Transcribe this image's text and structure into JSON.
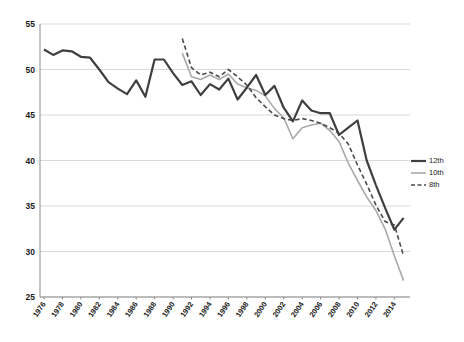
{
  "chart_data": {
    "type": "line",
    "title": "",
    "xlabel": "",
    "ylabel": "",
    "grid": "horizontal",
    "ylim": [
      25,
      55
    ],
    "yticks": [
      25,
      30,
      35,
      40,
      45,
      50,
      55
    ],
    "x_range": [
      1976,
      2015
    ],
    "xtick_labels": [
      "1976",
      "1978",
      "1980",
      "1982",
      "1984",
      "1986",
      "1988",
      "1990",
      "1992",
      "1994",
      "1996",
      "1998",
      "2000",
      "2002",
      "2004",
      "2006",
      "2008",
      "2010",
      "2012",
      "2014"
    ],
    "legend_position": "right",
    "axis_color": "#8c8c8c",
    "gridline_color": "#d9d9d9",
    "series": [
      {
        "name": "12th",
        "start_year": 1976,
        "style": "solid",
        "color": "#3f3f3f",
        "width": 2.2,
        "values": [
          52.2,
          51.6,
          52.1,
          52.0,
          51.4,
          51.3,
          50.0,
          48.6,
          47.9,
          47.3,
          48.8,
          47.0,
          51.1,
          51.1,
          49.6,
          48.3,
          48.7,
          47.2,
          48.4,
          47.8,
          49.0,
          46.7,
          48.0,
          49.4,
          47.2,
          48.2,
          45.8,
          44.3,
          46.6,
          45.5,
          45.2,
          45.2,
          42.8,
          43.6,
          44.4,
          40.0,
          37.3,
          34.8,
          32.4,
          33.7
        ]
      },
      {
        "name": "10th",
        "start_year": 1991,
        "style": "solid",
        "color": "#a9a9a9",
        "width": 1.6,
        "values": [
          51.8,
          49.2,
          48.9,
          49.4,
          48.9,
          49.5,
          48.4,
          48.0,
          47.7,
          47.1,
          45.7,
          44.7,
          42.4,
          43.6,
          43.9,
          44.1,
          43.3,
          42.1,
          39.7,
          37.8,
          36.0,
          34.5,
          32.5,
          29.5,
          26.8
        ]
      },
      {
        "name": "8th",
        "start_year": 1991,
        "style": "dashed",
        "color": "#4a4a4a",
        "width": 1.6,
        "values": [
          53.4,
          50.2,
          49.4,
          49.7,
          49.2,
          50.0,
          49.2,
          48.3,
          46.9,
          45.9,
          45.0,
          44.6,
          44.4,
          44.6,
          44.4,
          44.1,
          43.6,
          43.0,
          41.8,
          39.5,
          37.4,
          35.1,
          33.3,
          32.9,
          29.5
        ]
      }
    ]
  }
}
